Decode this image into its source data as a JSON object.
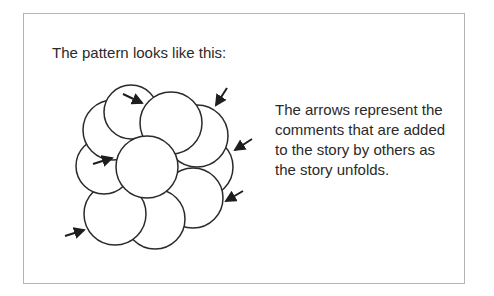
{
  "slide": {
    "title": "The pattern looks like this:",
    "description_lines": [
      "The arrows represent the",
      "comments that are added",
      "to the story by others as",
      "the story unfolds."
    ],
    "colors": {
      "frame_border": "#b4b4b4",
      "stroke": "#2a2a2a",
      "text": "#2a2a2a",
      "background": "#ffffff"
    }
  },
  "diagram": {
    "circle_count": 10,
    "arrow_count": 6,
    "arrow_icon": "arrow-icon"
  }
}
